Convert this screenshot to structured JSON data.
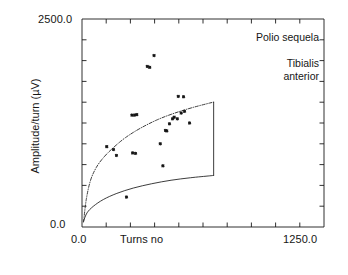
{
  "chart_data": {
    "type": "scatter",
    "title": "",
    "xlabel": "Turns no",
    "ylabel": "Amplitude/turn (µV)",
    "xlim": [
      0.0,
      1250.0
    ],
    "ylim": [
      0.0,
      2500.0
    ],
    "xticks": [
      0.0,
      125.0,
      250.0,
      375.0,
      500.0,
      625.0,
      750.0,
      875.0,
      1000.0,
      1125.0,
      1250.0
    ],
    "yticks": [
      0.0,
      250.0,
      500.0,
      750.0,
      1000.0,
      1250.0,
      1500.0,
      1750.0,
      2000.0,
      2250.0,
      2500.0
    ],
    "xtick_labels": [
      "0.0",
      "",
      "",
      "",
      "",
      "",
      "",
      "",
      "",
      "",
      "1250.0"
    ],
    "ytick_labels": [
      "0.0",
      "",
      "",
      "",
      "",
      "",
      "",
      "",
      "",
      "",
      "2500.0"
    ],
    "grid": false,
    "legend": false,
    "marker": "star",
    "annotations": [
      {
        "text": "Polio sequela",
        "x": 1030,
        "y": 2350
      },
      {
        "text": "Tibialis",
        "x": 1060,
        "y": 2090
      },
      {
        "text": "anterior",
        "x": 1060,
        "y": 1960
      }
    ],
    "series": [
      {
        "name": "Tibialis anterior turns/amplitude pairs",
        "type": "scatter",
        "points": [
          [
            128,
            965
          ],
          [
            163,
            930
          ],
          [
            178,
            860
          ],
          [
            258,
            1345
          ],
          [
            272,
            1345
          ],
          [
            283,
            1350
          ],
          [
            262,
            890
          ],
          [
            277,
            885
          ],
          [
            337,
            1930
          ],
          [
            350,
            1920
          ],
          [
            372,
            2060
          ],
          [
            404,
            1000
          ],
          [
            431,
            1160
          ],
          [
            438,
            1155
          ],
          [
            452,
            1240
          ],
          [
            468,
            1300
          ],
          [
            476,
            1320
          ],
          [
            492,
            1300
          ],
          [
            497,
            1570
          ],
          [
            525,
            1565
          ],
          [
            512,
            1370
          ],
          [
            530,
            1390
          ],
          [
            556,
            1250
          ],
          [
            418,
            735
          ],
          [
            230,
            360
          ]
        ]
      },
      {
        "name": "Upper normal limit (regression)",
        "type": "line",
        "style": "dash-dot",
        "points": [
          [
            8,
            60
          ],
          [
            22,
            330
          ],
          [
            44,
            560
          ],
          [
            75,
            720
          ],
          [
            115,
            845
          ],
          [
            165,
            960
          ],
          [
            225,
            1075
          ],
          [
            300,
            1185
          ],
          [
            390,
            1290
          ],
          [
            480,
            1370
          ],
          [
            570,
            1435
          ],
          [
            660,
            1490
          ],
          [
            680,
            1500
          ]
        ]
      },
      {
        "name": "Lower normal limit",
        "type": "line",
        "style": "solid",
        "points": [
          [
            8,
            70
          ],
          [
            26,
            170
          ],
          [
            58,
            248
          ],
          [
            110,
            330
          ],
          [
            180,
            404
          ],
          [
            265,
            468
          ],
          [
            360,
            520
          ],
          [
            460,
            562
          ],
          [
            560,
            592
          ],
          [
            660,
            615
          ],
          [
            680,
            620
          ]
        ]
      },
      {
        "name": "Right closing segment",
        "type": "line",
        "style": "solid",
        "points": [
          [
            680,
            1500
          ],
          [
            680,
            620
          ]
        ]
      }
    ]
  },
  "axis": {
    "ymax_label": "2500.0",
    "ymin_label": "0.0",
    "xmin_label": "0.0",
    "xmax_label": "1250.0",
    "x_title": "Turns no",
    "y_title": "Amplitude/turn (µV)"
  },
  "annotations": {
    "condition": "Polio sequela",
    "muscle_line1": "Tibialis",
    "muscle_line2": "anterior"
  },
  "colors": {
    "background": "#ffffff",
    "axis": "#1a1a1a",
    "marker": "#141414",
    "curve": "#1a1a1a"
  }
}
